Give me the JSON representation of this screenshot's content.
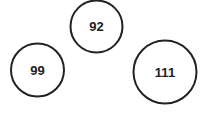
{
  "diagram": {
    "nodes": [
      {
        "id": "n1",
        "label": "92",
        "cx": 96.5,
        "cy": 26.5,
        "r": 26.5
      },
      {
        "id": "n2",
        "label": "99",
        "cx": 37.5,
        "cy": 70,
        "r": 27
      },
      {
        "id": "n3",
        "label": "111",
        "cx": 165,
        "cy": 72,
        "r": 32
      }
    ],
    "stroke_color": "#222222",
    "text_color": "#222222",
    "background": "#ffffff"
  }
}
